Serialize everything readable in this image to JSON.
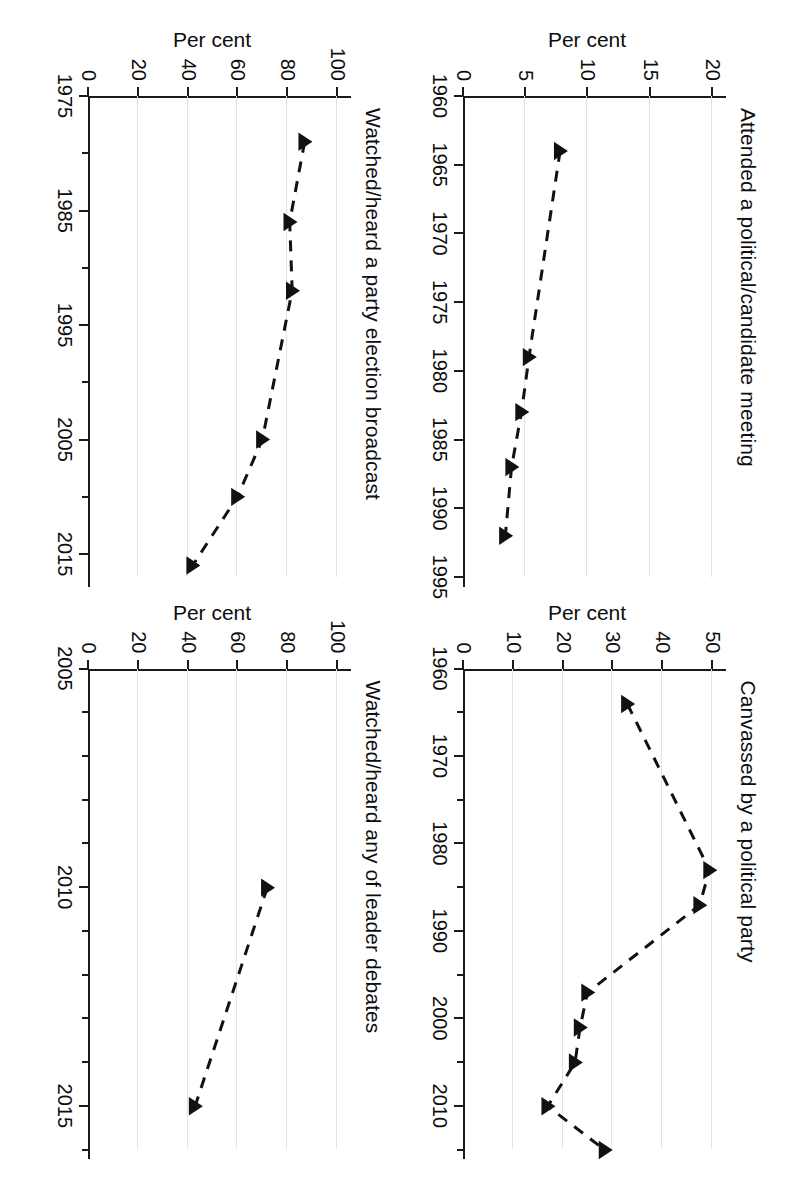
{
  "figure": {
    "orientation": "rotated-90-clockwise",
    "panel_count": 4,
    "ylabel": "Per cent",
    "marker": "filled-triangle",
    "line_style": "dashed",
    "series_color": "#111111",
    "grid_color": "#e2e2e2",
    "axis_color": "#1a1a1a"
  },
  "chart_data": [
    {
      "type": "line",
      "title": "Attended a political/candidate meeting",
      "xlabel": "",
      "ylabel": "Per cent",
      "xlim": [
        1960,
        1995
      ],
      "ylim": [
        0,
        20
      ],
      "xticks": [
        1960,
        1965,
        1970,
        1975,
        1980,
        1985,
        1990,
        1995
      ],
      "xticklabels": [
        "1960",
        "1965",
        "1970",
        "1975",
        "1980",
        "1985",
        "1990",
        "1995"
      ],
      "yticks": [
        0,
        5,
        10,
        15,
        20
      ],
      "yticklabels": [
        "0",
        "5",
        "10",
        "15",
        "20"
      ],
      "grid": true,
      "legend": "none",
      "x": [
        1964,
        1979,
        1983,
        1987,
        1992
      ],
      "values": [
        7.8,
        5.3,
        4.7,
        3.9,
        3.4
      ]
    },
    {
      "type": "line",
      "title": "Canvassed by a political party",
      "xlabel": "",
      "ylabel": "Per cent",
      "xlim": [
        1960,
        2015
      ],
      "ylim": [
        0,
        50
      ],
      "xticks": [
        1960,
        1965,
        1970,
        1975,
        1980,
        1985,
        1990,
        1995,
        2000,
        2005,
        2010,
        2015
      ],
      "xticklabels": [
        "1960",
        "",
        "1970",
        "",
        "1980",
        "",
        "1990",
        "",
        "2000",
        "",
        "2010",
        ""
      ],
      "yticks": [
        0,
        10,
        20,
        30,
        40,
        50
      ],
      "yticklabels": [
        "0",
        "10",
        "20",
        "30",
        "40",
        "50"
      ],
      "grid": true,
      "legend": "none",
      "x": [
        1964,
        1983,
        1987,
        1997,
        2001,
        2005,
        2010,
        2015
      ],
      "values": [
        33,
        49.5,
        47.5,
        25,
        23.5,
        22.5,
        17,
        28.5
      ]
    },
    {
      "type": "line",
      "title": "Watched/heard a party election broadcast",
      "xlabel": "",
      "ylabel": "Per cent",
      "xlim": [
        1975,
        2017
      ],
      "ylim": [
        0,
        100
      ],
      "xticks": [
        1975,
        1980,
        1985,
        1990,
        1995,
        2000,
        2005,
        2010,
        2015
      ],
      "xticklabels": [
        "1975",
        "",
        "1985",
        "",
        "1995",
        "",
        "2005",
        "",
        "2015"
      ],
      "yticks": [
        0,
        20,
        40,
        60,
        80,
        100
      ],
      "yticklabels": [
        "0",
        "20",
        "40",
        "60",
        "80",
        "100"
      ],
      "grid": true,
      "legend": "none",
      "x": [
        1979,
        1986,
        1992,
        2005,
        2010,
        2016
      ],
      "values": [
        87,
        81,
        82,
        70,
        60,
        42
      ]
    },
    {
      "type": "line",
      "title": "Watched/heard any of leader debates",
      "xlabel": "",
      "ylabel": "Per cent",
      "xlim": [
        2005,
        2016
      ],
      "ylim": [
        0,
        100
      ],
      "xticks": [
        2005,
        2006,
        2007,
        2008,
        2009,
        2010,
        2011,
        2012,
        2013,
        2014,
        2015,
        2016
      ],
      "xticklabels": [
        "2005",
        "",
        "",
        "",
        "",
        "2010",
        "",
        "",
        "",
        "",
        "2015",
        ""
      ],
      "yticks": [
        0,
        20,
        40,
        60,
        80,
        100
      ],
      "yticklabels": [
        "0",
        "20",
        "40",
        "60",
        "80",
        "100"
      ],
      "grid": true,
      "legend": "none",
      "x": [
        2010,
        2015
      ],
      "values": [
        72,
        43
      ]
    }
  ],
  "panels": [
    {
      "slot": "top-left",
      "chart_index": 0
    },
    {
      "slot": "top-right",
      "chart_index": 3
    },
    {
      "slot": "bottom-left",
      "chart_index": 2
    },
    {
      "slot": "bottom-right",
      "chart_index": 1
    }
  ]
}
